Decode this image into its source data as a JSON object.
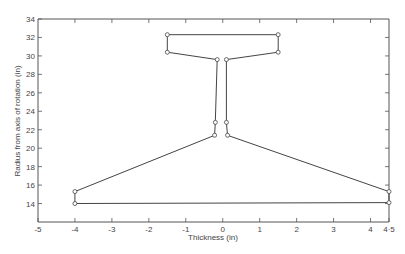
{
  "chart_data": {
    "type": "line",
    "title": "",
    "xlabel": "Thickness (in)",
    "ylabel": "Radius from axis of rotation (in)",
    "xlim": [
      -5,
      4.5
    ],
    "ylim": [
      12,
      34
    ],
    "grid": false,
    "legend": null,
    "x_ticks": [
      -5,
      -4,
      -3,
      -2,
      -1,
      0,
      1,
      2,
      3,
      4,
      4.5
    ],
    "x_tick_labels": [
      "-5",
      "-4",
      "-3",
      "-2",
      "-1",
      "0",
      "1",
      "2",
      "3",
      "4",
      "4·5"
    ],
    "y_ticks": [
      14,
      16,
      18,
      20,
      22,
      24,
      26,
      28,
      30,
      32,
      34
    ],
    "y_tick_labels": [
      "14",
      "16",
      "18",
      "20",
      "22",
      "24",
      "26",
      "28",
      "30",
      "32",
      "34"
    ],
    "series": [
      {
        "name": "cross-section outline",
        "closed": true,
        "markers": "open-circle",
        "points": [
          {
            "x": -4.0,
            "y": 14.0
          },
          {
            "x": -4.0,
            "y": 15.3
          },
          {
            "x": -0.22,
            "y": 21.4
          },
          {
            "x": -0.2,
            "y": 22.8
          },
          {
            "x": -0.15,
            "y": 29.6
          },
          {
            "x": -1.5,
            "y": 30.4
          },
          {
            "x": -1.5,
            "y": 32.3
          },
          {
            "x": 1.5,
            "y": 32.3
          },
          {
            "x": 1.5,
            "y": 30.4
          },
          {
            "x": 0.1,
            "y": 29.6
          },
          {
            "x": 0.1,
            "y": 22.8
          },
          {
            "x": 0.13,
            "y": 21.4
          },
          {
            "x": 4.5,
            "y": 15.3
          },
          {
            "x": 4.5,
            "y": 14.1
          }
        ]
      }
    ]
  },
  "colors": {
    "line": "#444444",
    "axis": "#555555",
    "background": "#ffffff"
  }
}
